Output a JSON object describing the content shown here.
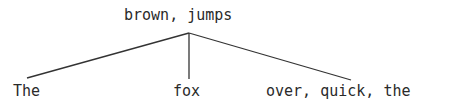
{
  "tree": {
    "root": {
      "label": "brown, jumps"
    },
    "children": [
      {
        "label": "The"
      },
      {
        "label": "fox"
      },
      {
        "label": "over, quick, the"
      }
    ]
  },
  "colors": {
    "text": "#2a2a2a",
    "edge": "#333333",
    "background": "#ffffff"
  }
}
